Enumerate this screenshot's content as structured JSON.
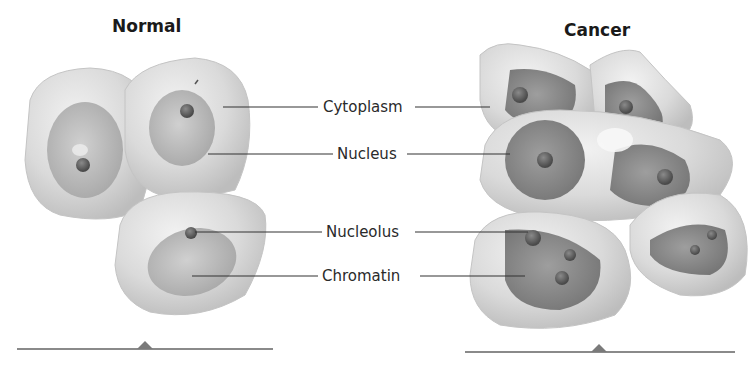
{
  "diagram": {
    "panels": [
      {
        "id": "normal",
        "title": "Normal"
      },
      {
        "id": "cancer",
        "title": "Cancer"
      }
    ],
    "labels": [
      {
        "text": "Cytoplasm"
      },
      {
        "text": "Nucleus"
      },
      {
        "text": "Nucleolus"
      },
      {
        "text": "Chromatin"
      }
    ],
    "colors": {
      "cytoplasm": "#d9d9d9",
      "nucleus_normal": "#b5b5b5",
      "nucleus_cancer": "#8f8f8f",
      "nucleolus": "#6a6a6a",
      "baseline": "#8a8a8a",
      "leader_line": "#333333"
    }
  }
}
